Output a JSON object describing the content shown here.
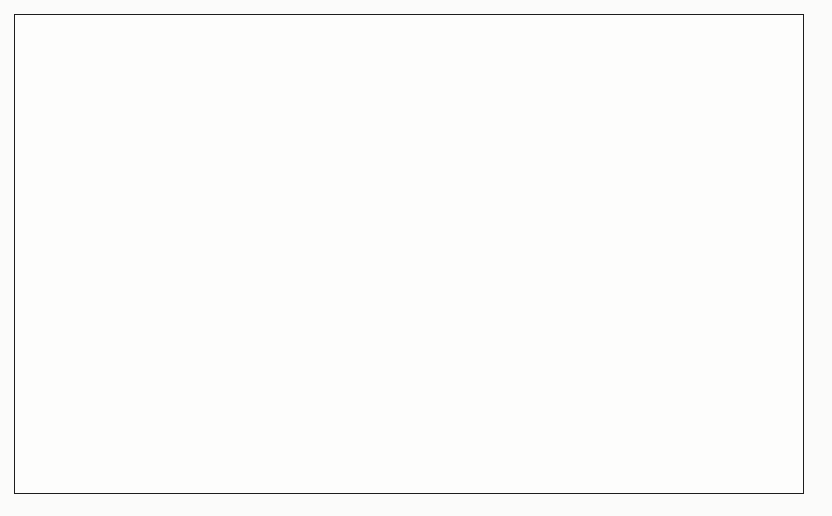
{
  "figure": {
    "border_color": "#1d1d1d",
    "background": "#fdfdfc"
  },
  "scan_fragments": {
    "left": "g",
    "middle": "p g yp",
    "right": "j"
  },
  "legend": {
    "position": "right",
    "items": [
      {
        "label": "Private Colleges",
        "color": "#b5b5b5",
        "marker": "square-swatch"
      },
      {
        "label": "Public Colleges",
        "color": "#5a5a5a",
        "marker": "square-swatch"
      }
    ]
  },
  "axis": {
    "y_ticks": [
      "0%",
      "10%",
      "20%",
      "30%",
      "40%",
      "50%",
      "60%",
      "70%",
      "80%",
      "90%",
      "100%"
    ],
    "x_ticks": [
      "1945",
      "1946",
      "1947",
      "1948",
      "1949",
      "1950",
      "1951",
      "1952",
      "1953",
      "1954",
      "1959",
      "1962",
      "1964",
      "1965",
      "1969",
      "1970",
      "1971",
      "1972",
      "1973",
      "1974"
    ]
  },
  "chart_data": {
    "type": "area",
    "stacked": true,
    "normalized": true,
    "title": "",
    "subtitle": "",
    "xlabel": "",
    "ylabel": "",
    "ylim": [
      0,
      100
    ],
    "y_tick_step": 10,
    "y_tick_format": "percent",
    "grid": false,
    "legend_position": "right",
    "categories": [
      "1945",
      "1946",
      "1947",
      "1948",
      "1949",
      "1950",
      "1951",
      "1952",
      "1953",
      "1954",
      "1959",
      "1962",
      "1964",
      "1965",
      "1969",
      "1970",
      "1971",
      "1972",
      "1973",
      "1974"
    ],
    "series": [
      {
        "name": "Public Colleges",
        "color": "#5a5a5a",
        "order": "bottom",
        "values": [
          46,
          45.5,
          49,
          48,
          51.5,
          55.5,
          54.5,
          56,
          58,
          60,
          56,
          53,
          66,
          65,
          64,
          66.5,
          67,
          68.5,
          68.5,
          69
        ]
      },
      {
        "name": "Private Colleges",
        "color": "#b5b5b5",
        "order": "top",
        "values": [
          54,
          54.5,
          51,
          52,
          48.5,
          44.5,
          45.5,
          44,
          42,
          40,
          44,
          47,
          34,
          35,
          36,
          33.5,
          33,
          31.5,
          31.5,
          31
        ]
      }
    ],
    "boundary_line": {
      "color": "#f2f2f0",
      "width": 2
    }
  }
}
